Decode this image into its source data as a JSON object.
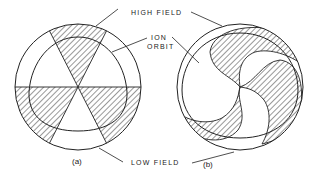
{
  "labels": {
    "high_field": "HIGH FIELD",
    "ion_orbit_line1": "ION",
    "ion_orbit_line2": "ORBIT",
    "low_field": "LOW FIELD"
  },
  "captions": {
    "a": "(a)",
    "b": "(b)"
  },
  "figure": {
    "panel_a": "Radial-sector pole pieces (three hatched high-field sectors) with triangular-ish ion orbit",
    "panel_b": "Spiral-sector pole pieces (three hatched spiral high-field sectors) with ion orbit"
  },
  "colors": {
    "ink": "#222222",
    "background": "#ffffff"
  }
}
